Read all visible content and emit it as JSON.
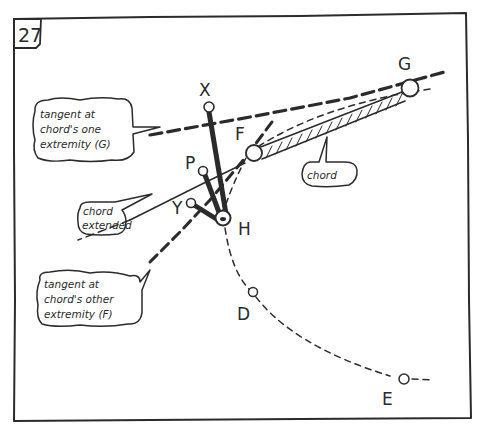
{
  "panel": {
    "number": "27"
  },
  "points": {
    "X": "X",
    "G": "G",
    "F": "F",
    "P": "P",
    "Y": "Y",
    "H": "H",
    "D": "D",
    "E": "E"
  },
  "callouts": {
    "tangent_g": [
      "tangent at",
      "chord's one",
      "extremity (G)"
    ],
    "chord": [
      "chord"
    ],
    "chord_extended": [
      "chord",
      "extended"
    ],
    "tangent_f": [
      "tangent at",
      "chord's other",
      "extremity (F)"
    ]
  },
  "colors": {
    "ink": "#2b2b2b",
    "paper": "#ffffff"
  }
}
